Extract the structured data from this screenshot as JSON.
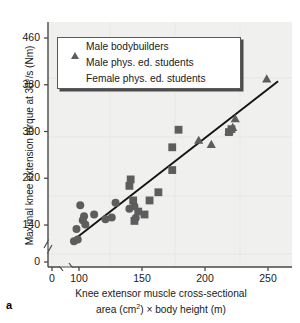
{
  "figure": {
    "panel_letter": "a",
    "background": "#f0f0ee",
    "marker_color": "#5d5d5d",
    "line_color": "#141414",
    "axis_color": "#4a4a4a"
  },
  "legend": {
    "entries": [
      {
        "marker": "triangle-icon",
        "label": "Male bodybuilders"
      },
      {
        "marker": "square-icon",
        "label": "Male phys. ed. students"
      },
      {
        "marker": "circle-icon",
        "label": "Female phys. ed. students"
      }
    ]
  },
  "chart_data": {
    "type": "scatter",
    "title": "",
    "xlabel_line1": "Knee extensor muscle cross-sectional",
    "xlabel_line2_pre": "area (cm",
    "xlabel_line2_sup": "2",
    "xlabel_line2_post": ") × body height (m)",
    "ylabel": "Maximal knee extension torque at 30°/s (Nm)",
    "xlim": [
      90,
      262
    ],
    "ylim": [
      105,
      470
    ],
    "xticks": [
      0,
      100,
      150,
      200,
      250
    ],
    "yticks": [
      0,
      140,
      220,
      300,
      380,
      460
    ],
    "x_axis_break": true,
    "y_axis_break": true,
    "grid": false,
    "legend_position": "upper-left",
    "trendline": {
      "x1": 95,
      "y1": 113,
      "x2": 258,
      "y2": 386
    },
    "series": [
      {
        "name": "Male bodybuilders",
        "marker": "triangle",
        "points": [
          [
            195,
            285
          ],
          [
            205,
            278
          ],
          [
            219,
            300
          ],
          [
            222,
            307
          ],
          [
            224,
            322
          ],
          [
            249,
            390
          ]
        ]
      },
      {
        "name": "Male phys. ed. students",
        "marker": "square",
        "points": [
          [
            140,
            207
          ],
          [
            141,
            218
          ],
          [
            143,
            182
          ],
          [
            144,
            147
          ],
          [
            147,
            163
          ],
          [
            152,
            158
          ],
          [
            156,
            182
          ],
          [
            163,
            196
          ],
          [
            174,
            273
          ],
          [
            174,
            234
          ],
          [
            179,
            303
          ],
          [
            219,
            299
          ],
          [
            221,
            304
          ]
        ]
      },
      {
        "name": "Female phys. ed. students",
        "marker": "circle",
        "points": [
          [
            96,
            112
          ],
          [
            98,
            133
          ],
          [
            99,
            115
          ],
          [
            101,
            174
          ],
          [
            103,
            148
          ],
          [
            104,
            155
          ],
          [
            105,
            141
          ],
          [
            112,
            158
          ],
          [
            121,
            150
          ],
          [
            126,
            153
          ],
          [
            129,
            178
          ],
          [
            140,
            168
          ],
          [
            144,
            172
          ],
          [
            145,
            152
          ]
        ]
      }
    ]
  }
}
